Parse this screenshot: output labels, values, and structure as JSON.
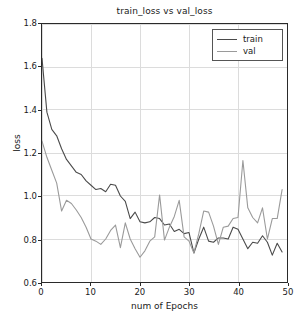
{
  "chart_data": {
    "type": "line",
    "title": "train_loss vs val_loss",
    "xlabel": "num of Epochs",
    "ylabel": "loss",
    "xlim": [
      0,
      50
    ],
    "ylim": [
      0.6,
      1.8
    ],
    "xticks": [
      0,
      10,
      20,
      30,
      40,
      50
    ],
    "xtick_labels": [
      "0",
      "10",
      "20",
      "30",
      "40",
      "50"
    ],
    "yticks": [
      0.6,
      0.8,
      1.0,
      1.2,
      1.4,
      1.6,
      1.8
    ],
    "ytick_labels": [
      "0.6",
      "0.8",
      "1.0",
      "1.2",
      "1.4",
      "1.6",
      "1.8"
    ],
    "grid": true,
    "legend_position": "upper right",
    "colors": {
      "train": "#4a4a4a",
      "val": "#9a9a9a",
      "grid": "#dcdcdc",
      "axes": "#2a2a2a",
      "background": "#ffffff"
    },
    "x": [
      0,
      1,
      2,
      3,
      4,
      5,
      6,
      7,
      8,
      9,
      10,
      11,
      12,
      13,
      14,
      15,
      16,
      17,
      18,
      19,
      20,
      21,
      22,
      23,
      24,
      25,
      26,
      27,
      28,
      29,
      30,
      31,
      32,
      33,
      34,
      35,
      36,
      37,
      38,
      39,
      40,
      41,
      42,
      43,
      44,
      45,
      46,
      47,
      48,
      49
    ],
    "series": [
      {
        "name": "train",
        "values": [
          1.64,
          1.39,
          1.31,
          1.28,
          1.22,
          1.17,
          1.14,
          1.11,
          1.1,
          1.07,
          1.05,
          1.03,
          1.035,
          1.02,
          1.055,
          1.05,
          1.0,
          0.975,
          0.895,
          0.925,
          0.88,
          0.875,
          0.88,
          0.9,
          0.895,
          0.865,
          0.87,
          0.835,
          0.845,
          0.825,
          0.83,
          0.735,
          0.8,
          0.855,
          0.79,
          0.785,
          0.805,
          0.805,
          0.8,
          0.855,
          0.845,
          0.8,
          0.755,
          0.785,
          0.78,
          0.815,
          0.785,
          0.725,
          0.78,
          0.74
        ]
      },
      {
        "name": "val",
        "values": [
          1.255,
          1.18,
          1.12,
          1.06,
          0.93,
          0.98,
          0.965,
          0.935,
          0.9,
          0.855,
          0.8,
          0.79,
          0.775,
          0.8,
          0.84,
          0.865,
          0.76,
          0.875,
          0.8,
          0.755,
          0.715,
          0.745,
          0.79,
          0.81,
          1.005,
          0.795,
          0.855,
          0.905,
          0.98,
          0.81,
          0.79,
          0.735,
          0.825,
          0.93,
          0.925,
          0.86,
          0.775,
          0.855,
          0.86,
          0.895,
          0.9,
          1.165,
          0.945,
          0.9,
          0.875,
          0.945,
          0.8,
          0.895,
          0.895,
          1.03
        ]
      }
    ]
  },
  "legend": {
    "entries": [
      {
        "label": "train",
        "color": "#4a4a4a"
      },
      {
        "label": "val",
        "color": "#9a9a9a"
      }
    ]
  }
}
